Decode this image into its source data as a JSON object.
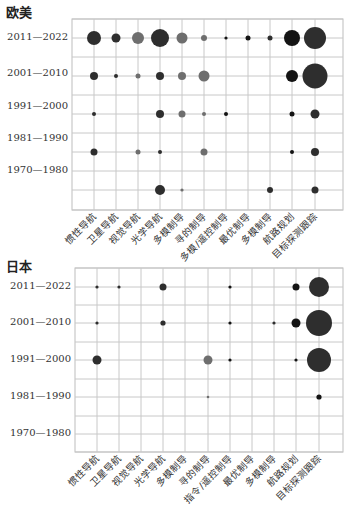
{
  "chart_data": [
    {
      "type": "scatter",
      "subtype": "bubble",
      "title": "欧美",
      "categories": [
        "惯性导航",
        "卫星导航",
        "视觉导航",
        "光学导航",
        "多模制导",
        "寻的制导",
        "多模/遥控制导",
        "最优制导",
        "多模制导",
        "航路规划",
        "目标探测跟踪"
      ],
      "rows": [
        "2011—2022",
        "2001—2010",
        "1991—2000",
        "1981—1990",
        "1970—1980"
      ],
      "points": [
        {
          "row": 0,
          "col": 0,
          "size": 7,
          "shade": "dark"
        },
        {
          "row": 0,
          "col": 1,
          "size": 4.5,
          "shade": "dark"
        },
        {
          "row": 0,
          "col": 2,
          "size": 6,
          "shade": "gray"
        },
        {
          "row": 0,
          "col": 3,
          "size": 9,
          "shade": "dark"
        },
        {
          "row": 0,
          "col": 4,
          "size": 5.5,
          "shade": "gray"
        },
        {
          "row": 0,
          "col": 5,
          "size": 3,
          "shade": "gray"
        },
        {
          "row": 0,
          "col": 6,
          "size": 1.6,
          "shade": "black"
        },
        {
          "row": 0,
          "col": 7,
          "size": 2.5,
          "shade": "black"
        },
        {
          "row": 0,
          "col": 8,
          "size": 2.5,
          "shade": "dark"
        },
        {
          "row": 0,
          "col": 9,
          "size": 8,
          "shade": "black"
        },
        {
          "row": 0,
          "col": 10,
          "size": 11,
          "shade": "dark"
        },
        {
          "row": 1,
          "col": 0,
          "size": 4,
          "shade": "dark"
        },
        {
          "row": 1,
          "col": 1,
          "size": 2,
          "shade": "dark"
        },
        {
          "row": 1,
          "col": 2,
          "size": 2.5,
          "shade": "gray"
        },
        {
          "row": 1,
          "col": 3,
          "size": 4,
          "shade": "dark"
        },
        {
          "row": 1,
          "col": 4,
          "size": 4,
          "shade": "gray"
        },
        {
          "row": 1,
          "col": 5,
          "size": 5.5,
          "shade": "gray"
        },
        {
          "row": 1,
          "col": 9,
          "size": 6,
          "shade": "black"
        },
        {
          "row": 1,
          "col": 10,
          "size": 12.5,
          "shade": "dark"
        },
        {
          "row": 2,
          "col": 0,
          "size": 2,
          "shade": "dark"
        },
        {
          "row": 2,
          "col": 3,
          "size": 4,
          "shade": "dark"
        },
        {
          "row": 2,
          "col": 4,
          "size": 3.5,
          "shade": "gray"
        },
        {
          "row": 2,
          "col": 5,
          "size": 2,
          "shade": "gray"
        },
        {
          "row": 2,
          "col": 6,
          "size": 2,
          "shade": "black"
        },
        {
          "row": 2,
          "col": 9,
          "size": 2.5,
          "shade": "black"
        },
        {
          "row": 2,
          "col": 10,
          "size": 4.5,
          "shade": "dark"
        },
        {
          "row": 3,
          "col": 0,
          "size": 3.5,
          "shade": "dark"
        },
        {
          "row": 3,
          "col": 2,
          "size": 2.5,
          "shade": "gray"
        },
        {
          "row": 3,
          "col": 3,
          "size": 2,
          "shade": "dark"
        },
        {
          "row": 3,
          "col": 5,
          "size": 3.5,
          "shade": "gray"
        },
        {
          "row": 3,
          "col": 9,
          "size": 2,
          "shade": "black"
        },
        {
          "row": 3,
          "col": 10,
          "size": 4,
          "shade": "dark"
        },
        {
          "row": 4,
          "col": 3,
          "size": 5,
          "shade": "dark"
        },
        {
          "row": 4,
          "col": 4,
          "size": 1.6,
          "shade": "gray"
        },
        {
          "row": 4,
          "col": 8,
          "size": 3,
          "shade": "dark"
        },
        {
          "row": 4,
          "col": 10,
          "size": 3.5,
          "shade": "dark"
        }
      ],
      "grid": true,
      "xlabel": "",
      "ylabel": ""
    },
    {
      "type": "scatter",
      "subtype": "bubble",
      "title": "日本",
      "categories": [
        "惯性导航",
        "卫星导航",
        "视觉导航",
        "光学导航",
        "多模制导",
        "寻的制导",
        "指令/遥控制导",
        "最优制导",
        "多模制导",
        "航路规划",
        "目标探测跟踪"
      ],
      "rows": [
        "2011—2022",
        "2001—2010",
        "1991—2000",
        "1981—1990",
        "1970—1980"
      ],
      "points": [
        {
          "row": 0,
          "col": 0,
          "size": 1.6,
          "shade": "dark"
        },
        {
          "row": 0,
          "col": 1,
          "size": 1.6,
          "shade": "dark"
        },
        {
          "row": 0,
          "col": 3,
          "size": 3.5,
          "shade": "dark"
        },
        {
          "row": 0,
          "col": 6,
          "size": 1.6,
          "shade": "black"
        },
        {
          "row": 0,
          "col": 9,
          "size": 3.5,
          "shade": "black"
        },
        {
          "row": 0,
          "col": 10,
          "size": 10,
          "shade": "dark"
        },
        {
          "row": 1,
          "col": 0,
          "size": 1.6,
          "shade": "dark"
        },
        {
          "row": 1,
          "col": 3,
          "size": 2.6,
          "shade": "dark"
        },
        {
          "row": 1,
          "col": 6,
          "size": 1.6,
          "shade": "black"
        },
        {
          "row": 1,
          "col": 8,
          "size": 1.6,
          "shade": "dark"
        },
        {
          "row": 1,
          "col": 9,
          "size": 4.5,
          "shade": "black"
        },
        {
          "row": 1,
          "col": 10,
          "size": 13,
          "shade": "dark"
        },
        {
          "row": 2,
          "col": 0,
          "size": 4.5,
          "shade": "dark"
        },
        {
          "row": 2,
          "col": 5,
          "size": 4.5,
          "shade": "gray"
        },
        {
          "row": 2,
          "col": 6,
          "size": 1.6,
          "shade": "black"
        },
        {
          "row": 2,
          "col": 9,
          "size": 1.6,
          "shade": "black"
        },
        {
          "row": 2,
          "col": 10,
          "size": 12,
          "shade": "dark"
        },
        {
          "row": 3,
          "col": 5,
          "size": 1.3,
          "shade": "gray"
        },
        {
          "row": 3,
          "col": 10,
          "size": 2.6,
          "shade": "black"
        }
      ],
      "grid": true,
      "xlabel": "",
      "ylabel": ""
    }
  ],
  "colors": {
    "black": "#141414",
    "dark": "#2e2e2e",
    "gray": "#6e6e6e",
    "grid": "#c8c8c8",
    "border": "#bdbdbd",
    "text": "#333333"
  },
  "layout": [
    {
      "title_pos": [
        6,
        2
      ],
      "plot": {
        "left": 72,
        "top": 19,
        "right": 343,
        "bottom": 210
      },
      "col_x": [
        94,
        116,
        138,
        160,
        182,
        204,
        226,
        248,
        270,
        292,
        315
      ],
      "row_y": [
        38,
        76,
        114,
        152,
        190
      ],
      "row_label_y": [
        38,
        74,
        107,
        139,
        171
      ],
      "hlines": [
        19,
        38,
        57,
        76,
        95,
        114,
        133,
        152,
        171,
        190,
        210
      ],
      "label_top": 214
    },
    {
      "title_pos": [
        6,
        256
      ],
      "plot": {
        "left": 75,
        "top": 268,
        "right": 343,
        "bottom": 452
      },
      "col_x": [
        97,
        119,
        141,
        163,
        185,
        208,
        230,
        252,
        274,
        296,
        319
      ],
      "row_y": [
        287,
        323,
        360,
        397,
        434
      ],
      "row_label_y": [
        287,
        323,
        360,
        397,
        434
      ],
      "hlines": [
        268,
        287,
        305,
        323,
        342,
        360,
        379,
        397,
        416,
        434,
        452
      ],
      "label_top": 456
    }
  ]
}
